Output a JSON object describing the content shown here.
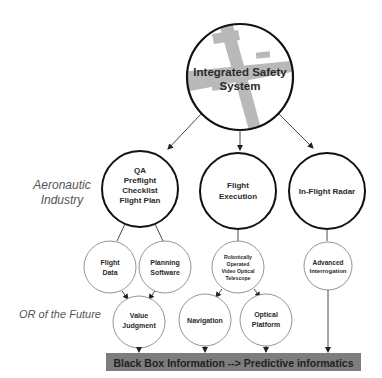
{
  "root": {
    "line1": "Integrated Safety",
    "line2": "System",
    "image": "airplane-silhouette"
  },
  "side_labels": {
    "aeronautic": {
      "line1": "Aeronautic",
      "line2": "Industry"
    },
    "future": "OR of the Future"
  },
  "level1": [
    {
      "lines": [
        "QA",
        "Preflight",
        "Checklist",
        "Flight Plan"
      ]
    },
    {
      "lines": [
        "Flight",
        "Execution"
      ]
    },
    {
      "lines": [
        "In-Flight Radar"
      ]
    }
  ],
  "level2": [
    {
      "lines": [
        "Flight",
        "Data"
      ]
    },
    {
      "lines": [
        "Planning",
        "Software"
      ]
    },
    {
      "lines": [
        "Robotically",
        "Operated",
        "Video Optical",
        "Telescope"
      ]
    },
    {
      "lines": [
        "Advanced",
        "Interrogation"
      ]
    }
  ],
  "level3": [
    {
      "lines": [
        "Value",
        "Judgment"
      ]
    },
    {
      "lines": [
        "Navigation"
      ]
    },
    {
      "lines": [
        "Optical",
        "Platform"
      ]
    }
  ],
  "bottom_bar": {
    "label": "Black Box Information --> Predictive informatics",
    "color": "#7a7a7a"
  },
  "colors": {
    "thick_stroke": "#111111",
    "thin_stroke": "#777777",
    "plane": "#b8b8b8"
  }
}
